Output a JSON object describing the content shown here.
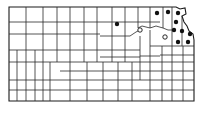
{
  "map": {
    "subject": "Kansas county map with occurrence records",
    "colors": {
      "line": "#2a2a2a",
      "dot": "#111111",
      "background": "#ffffff"
    },
    "filled_records": [
      {
        "x": 117,
        "y": 24
      },
      {
        "x": 157,
        "y": 13
      },
      {
        "x": 168,
        "y": 12
      },
      {
        "x": 178,
        "y": 13
      },
      {
        "x": 176,
        "y": 22
      },
      {
        "x": 174,
        "y": 30
      },
      {
        "x": 182,
        "y": 31
      },
      {
        "x": 190,
        "y": 34
      },
      {
        "x": 178,
        "y": 42
      },
      {
        "x": 188,
        "y": 42
      }
    ],
    "open_records": [
      {
        "x": 140,
        "y": 30
      },
      {
        "x": 165,
        "y": 37
      }
    ]
  }
}
